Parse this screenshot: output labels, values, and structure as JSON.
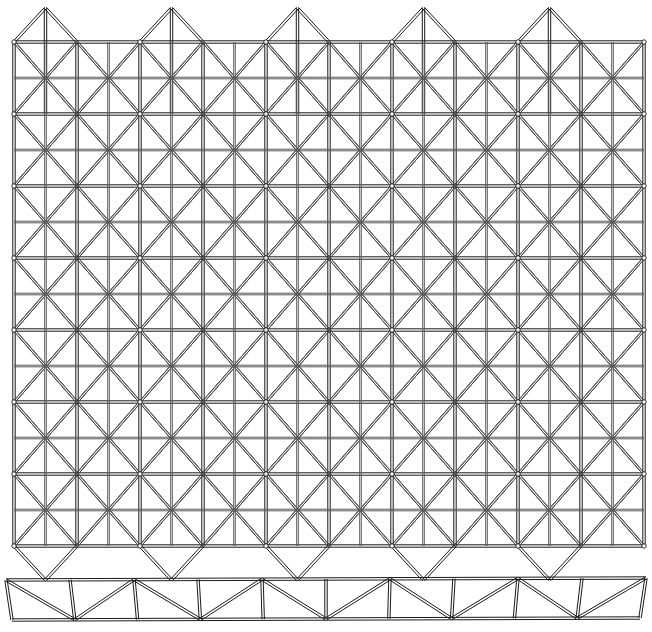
{
  "document": {
    "title": "Space Frame Lattice Drawing",
    "kind": "technical-line-drawing",
    "background_color": "#ffffff",
    "width": 652,
    "height": 632
  },
  "style": {
    "line_color": "#1a1a1a",
    "line_color_light": "#5a5a5a",
    "member_stroke_width": 1.0,
    "member_gap": 2.4,
    "hub_color": "#1a1a1a",
    "hub_radius": 2.2
  },
  "plan_view": {
    "label": "double-layer space frame plan",
    "origin_x": 14,
    "origin_y": 8,
    "columns": 5,
    "rows": 7,
    "cell_width": 126,
    "cell_height": 72,
    "half_width": 63,
    "peak_rise": 34,
    "top_edge_profile": "zigzag-peaks",
    "bottom_edge_profile": "zigzag-points",
    "top_peaks_x": [
      152,
      278,
      404,
      530
    ],
    "hub_columns_x": [
      26,
      89,
      152,
      215,
      278,
      341,
      404,
      467,
      530,
      593
    ],
    "hub_rows_y": [
      44,
      116,
      188,
      260,
      332,
      404,
      476,
      545
    ],
    "grid_left": 14,
    "grid_right": 641,
    "grid_top": 8,
    "grid_bottom": 545,
    "description": "Isometric triangulated lattice of hexagonal cells with star-shaped node hubs"
  },
  "elevation_view": {
    "label": "side elevation truss strip",
    "top_chord_y": 580,
    "bottom_chord_y": 620,
    "left_x": 6,
    "right_x": 646,
    "panel_width": 63,
    "panel_count": 10,
    "diagonal_pattern": "alternating-warren",
    "depth": 40,
    "skew": 6,
    "description": "Single-plane Warren truss with vertical posts and alternating diagonals"
  },
  "annotations": {
    "has_text_labels": false,
    "has_dimensions": false,
    "has_title_block": false
  }
}
